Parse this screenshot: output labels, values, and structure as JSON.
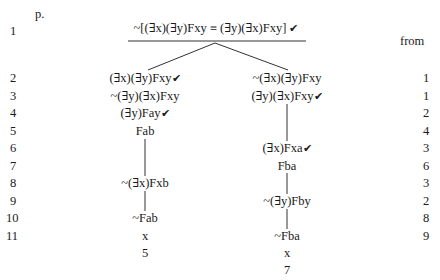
{
  "header": {
    "page_label": "p.",
    "from_label": "from"
  },
  "top": {
    "line_number": "1",
    "formula": "~[(∃x)(∃y)Fxy ≡ (∃y)(∃x)Fxy]",
    "checked": true
  },
  "line_numbers": [
    "2",
    "3",
    "4",
    "5",
    "6",
    "7",
    "8",
    "9",
    "10",
    "11"
  ],
  "from_numbers": [
    "1",
    "1",
    "2",
    "4",
    "3",
    "6",
    "3",
    "2",
    "8",
    "9"
  ],
  "left_branch": {
    "formulas": [
      {
        "text": "(∃x)(∃y)Fxy",
        "checked": true,
        "row": 2
      },
      {
        "text": "~(∃y)(∃x)Fxy",
        "checked": false,
        "row": 3
      },
      {
        "text": "(∃y)Fay",
        "checked": true,
        "row": 4
      },
      {
        "text": "Fab",
        "checked": false,
        "row": 5
      },
      {
        "text": "~(∃x)Fxb",
        "checked": false,
        "row": 8
      },
      {
        "text": "~Fab",
        "checked": false,
        "row": 10
      }
    ],
    "close_mark": "x",
    "close_ref": "5"
  },
  "right_branch": {
    "formulas": [
      {
        "text": "~(∃x)(∃y)Fxy",
        "checked": false,
        "row": 2
      },
      {
        "text": "(∃y)(∃x)Fxy",
        "checked": true,
        "row": 3
      },
      {
        "text": "(∃x)Fxa",
        "checked": true,
        "row": 6
      },
      {
        "text": "Fba",
        "checked": false,
        "row": 7
      },
      {
        "text": "~(∃y)Fby",
        "checked": false,
        "row": 9
      },
      {
        "text": "~Fba",
        "checked": false,
        "row": 11
      }
    ],
    "close_mark": "x",
    "close_ref": "7"
  },
  "check_glyph": "✔"
}
